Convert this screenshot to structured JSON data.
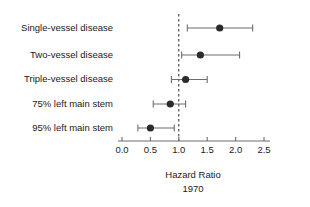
{
  "chart_data": {
    "type": "scatter",
    "subtype": "forest-plot",
    "title": "",
    "xlabel": "Hazard Ratio",
    "xlabel_sub": "1970",
    "ylabel": "",
    "xlim": [
      0.0,
      2.5
    ],
    "xticks": [
      0.0,
      0.5,
      1.0,
      1.5,
      2.0,
      2.5
    ],
    "xtick_labels": [
      "0.0",
      "0.5",
      "1.0",
      "1.5",
      "2.0",
      "2.5"
    ],
    "grid": false,
    "legend": null,
    "reference_line": 1.0,
    "categories": [
      "Single-vessel disease",
      "Two-vessel disease",
      "Triple-vessel disease",
      "75% left main stem",
      "95% left main stem"
    ],
    "values": [
      1.72,
      1.38,
      1.12,
      0.85,
      0.5
    ],
    "ci_low": [
      1.15,
      1.05,
      0.87,
      0.55,
      0.28
    ],
    "ci_high": [
      2.3,
      2.07,
      1.5,
      1.12,
      0.92
    ],
    "colors": {
      "point": "#2b2b2b",
      "line": "#6d6d6d",
      "axis": "#6d6d6d",
      "reference": "#2a2a2a",
      "text": "#1a1a1a",
      "background": "#ffffff"
    }
  }
}
